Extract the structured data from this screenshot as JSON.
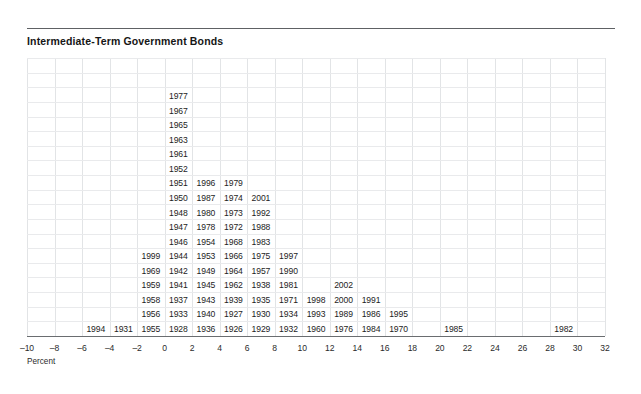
{
  "header": {
    "title": "Intermediate-Term Government Bonds"
  },
  "axis": {
    "caption": "Percent",
    "ticks": [
      "-10",
      "-8",
      "-6",
      "-4",
      "-2",
      "0",
      "2",
      "4",
      "6",
      "8",
      "10",
      "12",
      "14",
      "16",
      "18",
      "20",
      "22",
      "24",
      "26",
      "28",
      "30",
      "32"
    ]
  },
  "colors": {
    "title": "#161616",
    "rule": "#5e6164",
    "axis": "#6a6d70",
    "grid_vertical": "#e2e4e6",
    "grid_horizontal": "#e9eaec",
    "text": "#1d1d1d"
  },
  "chart_data": {
    "type": "bar",
    "title": "Intermediate-Term Government Bonds",
    "xlabel": "Percent",
    "ylabel": "",
    "xlim": [
      -10,
      32
    ],
    "bin_width": 2,
    "grid": true,
    "legend": null,
    "categories": [
      "-10 to -8",
      "-8 to -6",
      "-6 to -4",
      "-4 to -2",
      "-2 to 0",
      "0 to 2",
      "2 to 4",
      "4 to 6",
      "6 to 8",
      "8 to 10",
      "10 to 12",
      "12 to 14",
      "14 to 16",
      "16 to 18",
      "18 to 20",
      "20 to 22",
      "22 to 24",
      "24 to 26",
      "26 to 28",
      "28 to 30",
      "30 to 32"
    ],
    "values": [
      0,
      0,
      1,
      1,
      6,
      17,
      11,
      11,
      10,
      6,
      3,
      4,
      3,
      2,
      0,
      1,
      0,
      0,
      0,
      1,
      0
    ],
    "bins": [
      {
        "bin_start": -10,
        "bin_end": -8,
        "years": []
      },
      {
        "bin_start": -8,
        "bin_end": -6,
        "years": []
      },
      {
        "bin_start": -6,
        "bin_end": -4,
        "years": [
          "1994"
        ]
      },
      {
        "bin_start": -4,
        "bin_end": -2,
        "years": [
          "1931"
        ]
      },
      {
        "bin_start": -2,
        "bin_end": 0,
        "years": [
          "1955",
          "1956",
          "1958",
          "1959",
          "1969",
          "1999"
        ]
      },
      {
        "bin_start": 0,
        "bin_end": 2,
        "years": [
          "1928",
          "1933",
          "1937",
          "1941",
          "1942",
          "1944",
          "1946",
          "1947",
          "1948",
          "1950",
          "1951",
          "1952",
          "1961",
          "1963",
          "1965",
          "1967",
          "1977"
        ]
      },
      {
        "bin_start": 2,
        "bin_end": 4,
        "years": [
          "1936",
          "1940",
          "1943",
          "1945",
          "1949",
          "1953",
          "1954",
          "1978",
          "1980",
          "1987",
          "1996"
        ]
      },
      {
        "bin_start": 4,
        "bin_end": 6,
        "years": [
          "1926",
          "1927",
          "1939",
          "1962",
          "1964",
          "1966",
          "1968",
          "1972",
          "1973",
          "1974",
          "1979"
        ]
      },
      {
        "bin_start": 6,
        "bin_end": 8,
        "years": [
          "1929",
          "1930",
          "1935",
          "1938",
          "1957",
          "1975",
          "1983",
          "1988",
          "1992",
          "2001"
        ]
      },
      {
        "bin_start": 8,
        "bin_end": 10,
        "years": [
          "1932",
          "1934",
          "1971",
          "1981",
          "1990",
          "1997"
        ]
      },
      {
        "bin_start": 10,
        "bin_end": 12,
        "years": [
          "1960",
          "1993",
          "1998"
        ]
      },
      {
        "bin_start": 12,
        "bin_end": 14,
        "years": [
          "1976",
          "1989",
          "2000",
          "2002"
        ]
      },
      {
        "bin_start": 14,
        "bin_end": 16,
        "years": [
          "1984",
          "1986",
          "1991"
        ]
      },
      {
        "bin_start": 16,
        "bin_end": 18,
        "years": [
          "1970",
          "1995"
        ]
      },
      {
        "bin_start": 18,
        "bin_end": 20,
        "years": []
      },
      {
        "bin_start": 20,
        "bin_end": 22,
        "years": [
          "1985"
        ]
      },
      {
        "bin_start": 22,
        "bin_end": 24,
        "years": []
      },
      {
        "bin_start": 24,
        "bin_end": 26,
        "years": []
      },
      {
        "bin_start": 26,
        "bin_end": 28,
        "years": []
      },
      {
        "bin_start": 28,
        "bin_end": 30,
        "years": [
          "1982"
        ]
      },
      {
        "bin_start": 30,
        "bin_end": 32,
        "years": []
      }
    ]
  }
}
